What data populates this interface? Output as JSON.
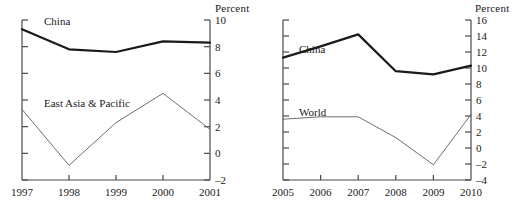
{
  "figure": {
    "panels": [
      {
        "id": "left",
        "unit_label": "Percent",
        "series_labels": {
          "primary": "China",
          "secondary": "East Asia & Pacific"
        }
      },
      {
        "id": "right",
        "unit_label": "Percent",
        "series_labels": {
          "primary": "China",
          "secondary": "World"
        }
      }
    ]
  },
  "chart_data": [
    {
      "type": "line",
      "title": "",
      "xlabel": "",
      "ylabel": "Percent",
      "x": [
        1997,
        1998,
        1999,
        2000,
        2001
      ],
      "xtick_labels": [
        "1997",
        "1998",
        "1999",
        "2000",
        "2001"
      ],
      "ylim": [
        -2,
        10
      ],
      "ytick_values": [
        10,
        8,
        6,
        4,
        2,
        0,
        -2
      ],
      "ytick_labels": [
        "10",
        "8",
        "6",
        "4",
        "2",
        "0",
        "–2"
      ],
      "yaxis_position": "right",
      "grid": false,
      "legend": "inline-annotations",
      "series": [
        {
          "name": "China",
          "color": "#1a1a1a",
          "width": 2.2,
          "values": [
            9.3,
            7.8,
            7.6,
            8.4,
            8.3
          ]
        },
        {
          "name": "East Asia & Pacific",
          "color": "#6e6e6e",
          "width": 1,
          "values": [
            3.3,
            -0.9,
            2.3,
            4.5,
            1.8
          ]
        }
      ]
    },
    {
      "type": "line",
      "title": "",
      "xlabel": "",
      "ylabel": "Percent",
      "x": [
        2005,
        2006,
        2007,
        2008,
        2009,
        2010
      ],
      "xtick_labels": [
        "2005",
        "2006",
        "2007",
        "2008",
        "2009",
        "2010"
      ],
      "ylim": [
        -4,
        16
      ],
      "ytick_values": [
        16,
        14,
        12,
        10,
        8,
        6,
        4,
        2,
        0,
        -2,
        -4
      ],
      "ytick_labels": [
        "16",
        "14",
        "12",
        "10",
        "8",
        "6",
        "4",
        "2",
        "0",
        "–2",
        "–4"
      ],
      "yaxis_position": "right",
      "grid": false,
      "legend": "inline-annotations",
      "series": [
        {
          "name": "China",
          "color": "#1a1a1a",
          "width": 2.2,
          "values": [
            11.3,
            12.7,
            14.2,
            9.6,
            9.2,
            10.3
          ]
        },
        {
          "name": "World",
          "color": "#6e6e6e",
          "width": 1,
          "values": [
            3.6,
            3.9,
            3.9,
            1.3,
            -2.1,
            4.2
          ]
        }
      ]
    }
  ]
}
